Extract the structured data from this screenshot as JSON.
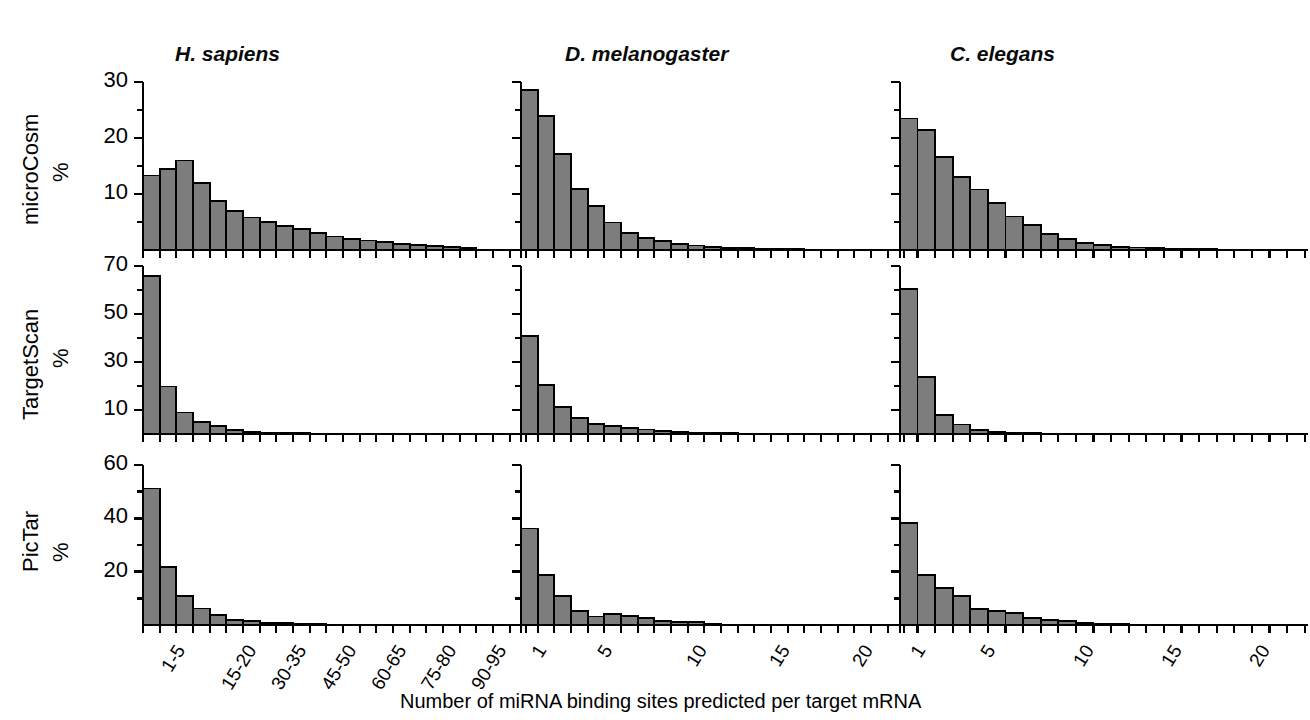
{
  "figure": {
    "xaxis_title": "Number of miRNA binding sites predicted per target mRNA",
    "column_titles": [
      "H. sapiens",
      "D. melanogaster",
      "C. elegans"
    ],
    "row_labels": [
      "microCosm",
      "TargetScan",
      "PicTar"
    ],
    "percent_symbol": "%",
    "bar_fill": "#7d7d7d",
    "bar_stroke": "#000000",
    "axis_color": "#000000"
  },
  "chart_data": [
    {
      "type": "bar",
      "title": "microCosm / H. sapiens",
      "xlabel": "Number of miRNA binding sites predicted per target mRNA",
      "ylabel": "microCosm %",
      "ylim": [
        0,
        30
      ],
      "yticks": [
        10,
        20,
        30
      ],
      "yticklabels": [
        "10",
        "20",
        "30"
      ],
      "grid": false,
      "categories": [
        "1-5",
        "5-10",
        "10-15",
        "15-20",
        "20-25",
        "25-30",
        "30-35",
        "35-40",
        "40-45",
        "45-50",
        "50-55",
        "55-60",
        "60-65",
        "65-70",
        "70-75",
        "75-80",
        "80-85",
        "85-90",
        "90-95",
        "95-100"
      ],
      "xticklabels": [
        "1-5",
        "15-20",
        "30-35",
        "45-50",
        "60-65",
        "75-80",
        "90-95"
      ],
      "xtick_positions": [
        0,
        3,
        6,
        9,
        12,
        15,
        18
      ],
      "values": [
        13.3,
        14.4,
        16.0,
        12.0,
        8.8,
        7.0,
        5.8,
        5.0,
        4.3,
        3.7,
        3.1,
        2.4,
        2.0,
        1.7,
        1.4,
        1.1,
        0.9,
        0.7,
        0.5,
        0.3
      ]
    },
    {
      "type": "bar",
      "title": "microCosm / D. melanogaster",
      "ylim": [
        0,
        30
      ],
      "yticks": [
        10,
        20,
        30
      ],
      "grid": false,
      "categories": [
        "1",
        "2",
        "3",
        "4",
        "5",
        "6",
        "7",
        "8",
        "9",
        "10",
        "11",
        "12",
        "13",
        "14",
        "15",
        "16",
        "17",
        "18",
        "19",
        "20"
      ],
      "xticklabels": [
        "1",
        "5",
        "10",
        "15",
        "20"
      ],
      "xtick_positions": [
        0,
        4,
        9,
        14,
        19
      ],
      "values": [
        28.6,
        23.9,
        17.2,
        10.9,
        7.8,
        4.9,
        3.1,
        2.2,
        1.6,
        1.1,
        0.8,
        0.6,
        0.4,
        0.3,
        0.25,
        0.2,
        0.15,
        0.1,
        0.1,
        0.05
      ]
    },
    {
      "type": "bar",
      "title": "microCosm / C. elegans",
      "ylim": [
        0,
        30
      ],
      "yticks": [
        10,
        20,
        30
      ],
      "grid": false,
      "categories": [
        "1",
        "2",
        "3",
        "4",
        "5",
        "6",
        "7",
        "8",
        "9",
        "10",
        "11",
        "12",
        "13",
        "14",
        "15",
        "16",
        "17",
        "18",
        "19",
        "20"
      ],
      "xticklabels": [
        "1",
        "5",
        "10",
        "15",
        "20"
      ],
      "xtick_positions": [
        0,
        4,
        9,
        14,
        19
      ],
      "values": [
        23.5,
        21.4,
        16.6,
        13.1,
        10.8,
        8.4,
        6.0,
        4.4,
        2.8,
        1.9,
        1.3,
        0.9,
        0.6,
        0.45,
        0.35,
        0.25,
        0.2,
        0.15,
        0.1,
        0.05
      ]
    },
    {
      "type": "bar",
      "title": "TargetScan / H. sapiens",
      "ylabel": "TargetScan %",
      "ylim": [
        0,
        70
      ],
      "yticks": [
        10,
        30,
        50,
        70
      ],
      "yticklabels": [
        "10",
        "30",
        "50",
        "70"
      ],
      "grid": false,
      "categories": [
        "1-5",
        "5-10",
        "10-15",
        "15-20",
        "20-25",
        "25-30",
        "30-35",
        "35-40",
        "40-45",
        "45-50",
        "50-55",
        "55-60",
        "60-65",
        "65-70",
        "70-75",
        "75-80",
        "80-85",
        "85-90",
        "90-95",
        "95-100"
      ],
      "xticklabels": [
        "1-5",
        "15-20",
        "30-35",
        "45-50",
        "60-65",
        "75-80",
        "90-95"
      ],
      "xtick_positions": [
        0,
        3,
        6,
        9,
        12,
        15,
        18
      ],
      "values": [
        66.0,
        19.8,
        9.0,
        5.0,
        3.2,
        1.8,
        1.0,
        0.6,
        0.4,
        0.3,
        0.2,
        0.15,
        0.1,
        0.1,
        0.05,
        0.05,
        0.05,
        0.0,
        0.0,
        0.0
      ]
    },
    {
      "type": "bar",
      "title": "TargetScan / D. melanogaster",
      "ylim": [
        0,
        70
      ],
      "yticks": [
        10,
        30,
        50,
        70
      ],
      "grid": false,
      "categories": [
        "1",
        "2",
        "3",
        "4",
        "5",
        "6",
        "7",
        "8",
        "9",
        "10",
        "11",
        "12",
        "13",
        "14",
        "15",
        "16",
        "17",
        "18",
        "19",
        "20"
      ],
      "xticklabels": [
        "1",
        "5",
        "10",
        "15",
        "20"
      ],
      "xtick_positions": [
        0,
        4,
        9,
        14,
        19
      ],
      "values": [
        40.9,
        20.5,
        11.3,
        6.8,
        4.2,
        3.4,
        2.6,
        1.9,
        1.3,
        0.9,
        0.6,
        0.4,
        0.3,
        0.2,
        0.15,
        0.1,
        0.1,
        0.05,
        0.05,
        0.0
      ]
    },
    {
      "type": "bar",
      "title": "TargetScan / C. elegans",
      "ylim": [
        0,
        70
      ],
      "yticks": [
        10,
        30,
        50,
        70
      ],
      "grid": false,
      "categories": [
        "1",
        "2",
        "3",
        "4",
        "5",
        "6",
        "7",
        "8",
        "9",
        "10",
        "11",
        "12",
        "13",
        "14",
        "15",
        "16",
        "17",
        "18",
        "19",
        "20"
      ],
      "xticklabels": [
        "1",
        "5",
        "10",
        "15",
        "20"
      ],
      "xtick_positions": [
        0,
        4,
        9,
        14,
        19
      ],
      "values": [
        60.5,
        23.9,
        7.9,
        4.0,
        1.6,
        0.9,
        0.5,
        0.3,
        0.2,
        0.15,
        0.1,
        0.05,
        0.05,
        0.0,
        0.0,
        0.0,
        0.0,
        0.0,
        0.0,
        0.0
      ]
    },
    {
      "type": "bar",
      "title": "PicTar / H. sapiens",
      "ylabel": "PicTar %",
      "ylim": [
        0,
        60
      ],
      "yticks": [
        20,
        40,
        60
      ],
      "yticklabels": [
        "20",
        "40",
        "60"
      ],
      "grid": false,
      "categories": [
        "1-5",
        "5-10",
        "10-15",
        "15-20",
        "20-25",
        "25-30",
        "30-35",
        "35-40",
        "40-45",
        "45-50",
        "50-55",
        "55-60",
        "60-65",
        "65-70",
        "70-75",
        "75-80",
        "80-85",
        "85-90",
        "90-95",
        "95-100"
      ],
      "xticklabels": [
        "1-5",
        "15-20",
        "30-35",
        "45-50",
        "60-65",
        "75-80",
        "90-95"
      ],
      "xtick_positions": [
        0,
        3,
        6,
        9,
        12,
        15,
        18
      ],
      "values": [
        51.2,
        21.8,
        11.0,
        6.2,
        3.8,
        2.0,
        1.4,
        0.9,
        0.6,
        0.4,
        0.3,
        0.2,
        0.15,
        0.1,
        0.1,
        0.05,
        0.05,
        0.0,
        0.0,
        0.0
      ]
    },
    {
      "type": "bar",
      "title": "PicTar / D. melanogaster",
      "ylim": [
        0,
        60
      ],
      "yticks": [
        20,
        40,
        60
      ],
      "grid": false,
      "categories": [
        "1",
        "2",
        "3",
        "4",
        "5",
        "6",
        "7",
        "8",
        "9",
        "10",
        "11",
        "12",
        "13",
        "14",
        "15",
        "16",
        "17",
        "18",
        "19",
        "20"
      ],
      "xticklabels": [
        "1",
        "5",
        "10",
        "15",
        "20"
      ],
      "xtick_positions": [
        0,
        4,
        9,
        14,
        19
      ],
      "values": [
        36.2,
        18.8,
        11.0,
        5.2,
        3.2,
        4.0,
        3.3,
        2.7,
        1.6,
        1.1,
        1.0,
        0.3,
        0.2,
        0.15,
        0.1,
        0.1,
        0.05,
        0.05,
        0.0,
        0.0
      ]
    },
    {
      "type": "bar",
      "title": "PicTar / C. elegans",
      "ylim": [
        0,
        60
      ],
      "yticks": [
        20,
        40,
        60
      ],
      "grid": false,
      "categories": [
        "1",
        "2",
        "3",
        "4",
        "5",
        "6",
        "7",
        "8",
        "9",
        "10",
        "11",
        "12",
        "13",
        "14",
        "15",
        "16",
        "17",
        "18",
        "19",
        "20"
      ],
      "xticklabels": [
        "1",
        "5",
        "10",
        "15",
        "20"
      ],
      "xtick_positions": [
        0,
        4,
        9,
        14,
        19
      ],
      "values": [
        38.2,
        18.8,
        14.0,
        10.8,
        6.0,
        5.4,
        4.4,
        2.6,
        2.0,
        1.4,
        0.9,
        0.5,
        0.3,
        0.2,
        0.15,
        0.1,
        0.05,
        0.05,
        0.0,
        0.0
      ]
    }
  ]
}
